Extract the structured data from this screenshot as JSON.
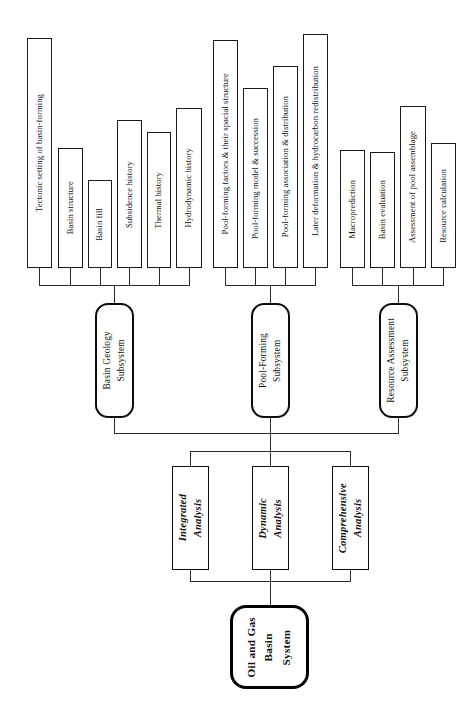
{
  "diagram": {
    "orientation": "rotated-90-ccw",
    "background_color": "#ffffff",
    "line_color": "#2b2b2b",
    "text_color": "#111111",
    "root": {
      "label": "Oil and Gas Basin System",
      "lines": [
        "Oil and Gas",
        "Basin",
        "System"
      ]
    },
    "analysis_level": [
      {
        "label": "Integrated Analysis",
        "lines": [
          "Integrated",
          "Analysis"
        ]
      },
      {
        "label": "Dynamic Analysis",
        "lines": [
          "Dynamic",
          "Analysis"
        ]
      },
      {
        "label": "Comprehensive Analysis",
        "lines": [
          "Comprehensive",
          "Analysis"
        ]
      }
    ],
    "subsystems": [
      {
        "label": "Basin Geology Subsystem",
        "lines": [
          "Basin Geology",
          "Subsystem"
        ],
        "children": [
          "Tectonic setting of basin-forming",
          "Basin structure",
          "Basin fill",
          "Subsidence history",
          "Thermal history",
          "Hydrodynamic history"
        ]
      },
      {
        "label": "Pool-Forming Subsystem",
        "lines": [
          "Pool-Forming",
          "Subsystem"
        ],
        "children": [
          "Pool-forming factors & their spacial structure",
          "Pool-forming model & succession",
          "Pool-forming association & distribution",
          "Later deformation & hydrocarbon redistribution"
        ]
      },
      {
        "label": "Resource Assessment Subsystem",
        "lines": [
          "Resource Assessment",
          "Subsystem"
        ],
        "children": [
          "Macroprediction",
          "Basin evaluation",
          "Assessment of pool assemblage",
          "Resource calculation"
        ]
      }
    ]
  }
}
